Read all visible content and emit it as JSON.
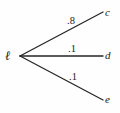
{
  "diagram": {
    "type": "probability-tree",
    "background_color": "#fefefe",
    "stroke_color": "#262626",
    "text_color": "#1a1a1a",
    "root": {
      "id": "root",
      "label": "ℓ",
      "x": 20,
      "y": 56
    },
    "branches": [
      {
        "id": "branch-c",
        "weight": ".8",
        "target_label": "c",
        "from_x": 20,
        "from_y": 56,
        "to_x": 103,
        "to_y": 12
      },
      {
        "id": "branch-d",
        "weight": ".1",
        "target_label": "d",
        "from_x": 20,
        "from_y": 56,
        "to_x": 103,
        "to_y": 56
      },
      {
        "id": "branch-e",
        "weight": ".1",
        "target_label": "e",
        "from_x": 20,
        "from_y": 56,
        "to_x": 103,
        "to_y": 100
      }
    ]
  }
}
